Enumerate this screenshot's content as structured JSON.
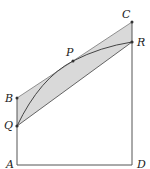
{
  "diagram": {
    "type": "geometry",
    "colors": {
      "line": "#444444",
      "shade": "#d9d9d9",
      "point": "#333333",
      "label": "#222222"
    },
    "points": {
      "A": {
        "label": "A",
        "x": 17,
        "y": 165
      },
      "B": {
        "label": "B",
        "x": 17,
        "y": 98
      },
      "Q": {
        "label": "Q",
        "x": 17,
        "y": 126
      },
      "C": {
        "label": "C",
        "x": 132,
        "y": 22
      },
      "R": {
        "label": "R",
        "x": 132,
        "y": 42
      },
      "D": {
        "label": "D",
        "x": 132,
        "y": 165
      },
      "P": {
        "label": "P",
        "x": 73,
        "y": 61
      }
    },
    "shaded_region": [
      "B",
      "C",
      "R",
      "Q"
    ],
    "segments": [
      [
        "A",
        "D"
      ],
      [
        "A",
        "Q"
      ],
      [
        "Q",
        "B"
      ],
      [
        "B",
        "C"
      ],
      [
        "C",
        "R"
      ],
      [
        "R",
        "D"
      ],
      [
        "Q",
        "R"
      ]
    ],
    "curve": [
      "Q",
      "P",
      "R"
    ]
  }
}
